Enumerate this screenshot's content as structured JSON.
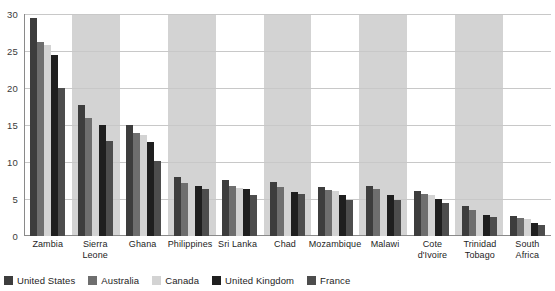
{
  "chart_data": {
    "type": "bar",
    "title": "",
    "subtitle": "",
    "xlabel": "",
    "ylabel": "",
    "ylim": [
      0,
      30
    ],
    "yticks": [
      0,
      5,
      10,
      15,
      20,
      25,
      30
    ],
    "ytick_labels": [
      "0",
      "5",
      "10",
      "15",
      "20",
      "25",
      "30"
    ],
    "grid": true,
    "legend_position": "bottom",
    "categories": [
      "Zambia",
      "Sierra Leone",
      "Ghana",
      "Philippines",
      "Sri Lanka",
      "Chad",
      "Mozambique",
      "Malawi",
      "Cote d'Ivoire",
      "Trinidad Tobago",
      "South Africa"
    ],
    "category_lines": [
      [
        "Zambia"
      ],
      [
        "Sierra",
        "Leone"
      ],
      [
        "Ghana"
      ],
      [
        "Philippines"
      ],
      [
        "Sri Lanka"
      ],
      [
        "Chad"
      ],
      [
        "Mozambique"
      ],
      [
        "Malawi"
      ],
      [
        "Cote",
        "d'Ivoire"
      ],
      [
        "Trinidad",
        "Tobago"
      ],
      [
        "South",
        "Africa"
      ]
    ],
    "shaded_band_categories": [
      "Sierra Leone",
      "Philippines",
      "Chad",
      "Malawi",
      "Trinidad Tobago"
    ],
    "shaded_band_color": "#d3d3d3",
    "series": [
      {
        "name": "United States",
        "color": "#3d3d3d",
        "values": [
          29.5,
          17.7,
          15.0,
          8.0,
          7.6,
          7.3,
          6.6,
          6.7,
          6.1,
          4.0,
          2.7
        ]
      },
      {
        "name": "Australia",
        "color": "#6e6e6e",
        "values": [
          26.2,
          15.9,
          13.9,
          7.2,
          6.8,
          6.6,
          6.2,
          6.3,
          5.7,
          3.5,
          2.5
        ]
      },
      {
        "name": "Canada",
        "color": "#d3d3d3",
        "values": [
          25.8,
          15.7,
          13.6,
          7.0,
          6.5,
          6.4,
          6.1,
          6.1,
          5.5,
          3.3,
          2.3
        ]
      },
      {
        "name": "United Kingdom",
        "color": "#1f1f1f",
        "values": [
          24.4,
          15.0,
          12.7,
          6.7,
          6.3,
          6.0,
          5.5,
          5.6,
          5.0,
          2.9,
          1.7
        ]
      },
      {
        "name": "France",
        "color": "#4d4d4d",
        "values": [
          20.0,
          12.9,
          10.1,
          6.4,
          5.6,
          5.7,
          4.8,
          4.8,
          4.5,
          2.6,
          1.5
        ]
      }
    ]
  }
}
